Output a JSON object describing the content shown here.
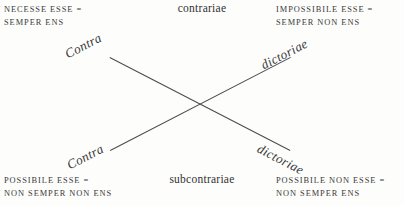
{
  "figure": {
    "kind": "square-of-opposition",
    "background_color": "#fdfdfb",
    "ink_color": "#3a3a3c",
    "line_color": "#4a4a4e"
  },
  "corners": {
    "top_left": {
      "line1": "NECESSE ESSE =",
      "line2": "SEMPER ENS"
    },
    "top_right": {
      "line1": "IMPOSSIBILE ESSE =",
      "line2": "SEMPER NON ENS"
    },
    "bottom_left": {
      "line1": "POSSIBILE ESSE =",
      "line2": "NON SEMPER NON ENS"
    },
    "bottom_right": {
      "line1": "POSSIBILE NON ESSE =",
      "line2": "NON SEMPER ENS"
    }
  },
  "captions": {
    "top": "contrariae",
    "bottom": "subcontrariae"
  },
  "diagonal_labels": {
    "upper_left": "Contra",
    "upper_right": "dictoriae",
    "lower_left": "Contra",
    "lower_right": "dictoriae"
  }
}
